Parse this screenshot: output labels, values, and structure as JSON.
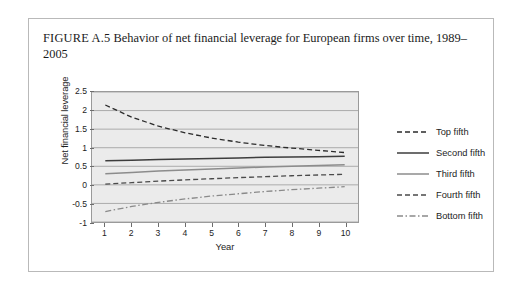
{
  "figure": {
    "label": "FIGURE A.5",
    "caption": "Behavior of net financial leverage for European firms over time, 1989–2005"
  },
  "chart_data": {
    "type": "line",
    "title": "Behavior of net financial leverage for European firms over time, 1989–2005",
    "xlabel": "Year",
    "ylabel": "Net financial leverage",
    "x": [
      1,
      2,
      3,
      4,
      5,
      6,
      7,
      8,
      9,
      10
    ],
    "xlim": [
      0.5,
      10.5
    ],
    "ylim": [
      -1,
      2.5
    ],
    "ytick_labels": [
      "2.5",
      "2",
      "1.5",
      "1",
      "0.5",
      "0",
      "-0.5",
      "-1"
    ],
    "ytick_values": [
      2.5,
      2,
      1.5,
      1,
      0.5,
      0,
      -0.5,
      -1
    ],
    "xtick_labels": [
      "1",
      "2",
      "3",
      "4",
      "5",
      "6",
      "7",
      "8",
      "9",
      "10"
    ],
    "grid": "horizontal",
    "legend_position": "right",
    "series": [
      {
        "name": "Top fifth",
        "style": "dashed",
        "color": "#2b2b2b",
        "values": [
          2.15,
          1.82,
          1.58,
          1.4,
          1.26,
          1.15,
          1.06,
          0.99,
          0.93,
          0.87
        ]
      },
      {
        "name": "Second fifth",
        "style": "solid",
        "color": "#3d3d3d",
        "values": [
          0.65,
          0.665,
          0.68,
          0.695,
          0.71,
          0.725,
          0.74,
          0.75,
          0.76,
          0.77
        ]
      },
      {
        "name": "Third fifth",
        "style": "solid",
        "color": "#8c8c8c",
        "values": [
          0.3,
          0.335,
          0.37,
          0.4,
          0.43,
          0.455,
          0.48,
          0.5,
          0.52,
          0.54
        ]
      },
      {
        "name": "Fourth fifth",
        "style": "dashed",
        "color": "#4a4a4a",
        "values": [
          0.02,
          0.06,
          0.1,
          0.135,
          0.165,
          0.195,
          0.22,
          0.245,
          0.265,
          0.285
        ]
      },
      {
        "name": "Bottom fifth",
        "style": "dashdot",
        "color": "#8a8a8a",
        "values": [
          -0.72,
          -0.58,
          -0.47,
          -0.38,
          -0.3,
          -0.24,
          -0.18,
          -0.13,
          -0.09,
          -0.05
        ]
      }
    ]
  }
}
